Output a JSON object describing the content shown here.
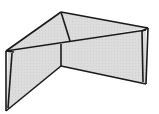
{
  "diagram": {
    "colors": {
      "fill": "#d9d9d9",
      "stroke": "#1a1a1a",
      "background": "#ffffff"
    },
    "vertices": {
      "top_back": [
        61,
        12
      ],
      "right_top": [
        148,
        28
      ],
      "right_bottom": [
        146,
        84
      ],
      "mid_top": [
        61,
        43
      ],
      "mid_inner": [
        70,
        41
      ],
      "mid_bottom": [
        61,
        66
      ],
      "left_top": [
        6,
        51
      ],
      "left_bottom": [
        6,
        111
      ]
    }
  }
}
